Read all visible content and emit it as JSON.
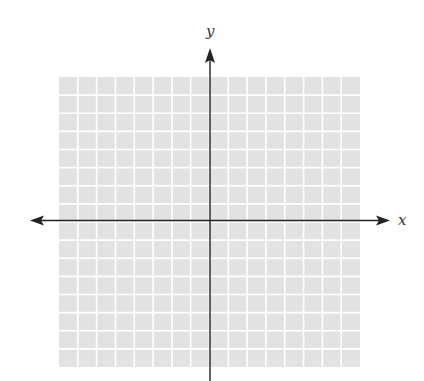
{
  "chart_data": {
    "type": "scatter",
    "title": "",
    "xlabel": "x",
    "ylabel": "y",
    "series": [],
    "grid": true,
    "grid_divisions": {
      "x": 16,
      "y": 16
    },
    "tick_labels": {
      "x": [],
      "y": []
    },
    "axis_ranges_assumed": {
      "xlim": [
        -8,
        8
      ],
      "ylim": [
        -8,
        8
      ]
    },
    "axis_ranges_note": "No tick labels are visible; ranges are an assumed symmetric convention for a 16-division grid, not read from the image.",
    "legend": null,
    "axes": {
      "x_arrows": "both",
      "y_arrows": "up"
    }
  },
  "colors": {
    "grid_fill": "#e2e2e2",
    "grid_lines": "#ffffff",
    "axis": "#222222",
    "label": "#333333"
  },
  "labels": {
    "x_axis": "x",
    "y_axis": "y"
  }
}
